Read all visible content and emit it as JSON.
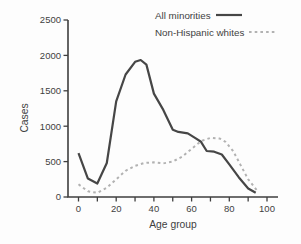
{
  "figure": {
    "background_color": "#fdfdfd",
    "ink_color": "#3f3f3f"
  },
  "chart_data": {
    "type": "line",
    "title": "",
    "xlabel": "Age group",
    "ylabel": "Cases",
    "xlim": [
      0,
      100
    ],
    "ylim": [
      0,
      2500
    ],
    "x_major_ticks": [
      0,
      20,
      40,
      60,
      80,
      100
    ],
    "x_minor_tick_step": 10,
    "y_ticks": [
      0,
      500,
      1000,
      1500,
      2000,
      2500
    ],
    "grid": false,
    "legend_position": "top-right",
    "axis_color": "#3f3f3f",
    "series": [
      {
        "name": "All minorities",
        "line_style": "solid",
        "color": "#464646",
        "x": [
          0,
          5,
          10,
          15,
          20,
          25,
          30,
          33,
          36,
          40,
          45,
          50,
          53,
          58,
          62,
          65,
          68,
          72,
          76,
          80,
          85,
          90,
          94
        ],
        "values": [
          620,
          260,
          190,
          480,
          1350,
          1730,
          1910,
          1935,
          1870,
          1460,
          1230,
          950,
          920,
          900,
          830,
          780,
          650,
          640,
          600,
          460,
          280,
          120,
          60
        ]
      },
      {
        "name": "Non-Hispanic whites",
        "line_style": "dotted",
        "color": "#b2b2b2",
        "x": [
          0,
          5,
          10,
          15,
          20,
          25,
          30,
          35,
          40,
          45,
          50,
          55,
          60,
          65,
          70,
          75,
          78,
          82,
          86,
          90,
          95
        ],
        "values": [
          180,
          80,
          60,
          130,
          250,
          370,
          440,
          480,
          490,
          475,
          500,
          570,
          680,
          790,
          835,
          825,
          780,
          650,
          450,
          250,
          80
        ]
      }
    ]
  }
}
